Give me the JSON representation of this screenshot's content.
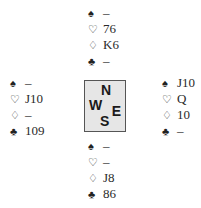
{
  "suits": {
    "spade": "♠",
    "heart": "♡",
    "diamond": "♢",
    "club": "♣"
  },
  "hands": {
    "north": {
      "spades": "–",
      "hearts": "76",
      "diamonds": "K6",
      "clubs": "–"
    },
    "west": {
      "spades": "–",
      "hearts": "J10",
      "diamonds": "–",
      "clubs": "109"
    },
    "east": {
      "spades": "J10",
      "hearts": "Q",
      "diamonds": "10",
      "clubs": "–"
    },
    "south": {
      "spades": "–",
      "hearts": "–",
      "diamonds": "J8",
      "clubs": "86"
    }
  },
  "compass": {
    "n": "N",
    "w": "W",
    "e": "E",
    "s": "S"
  }
}
